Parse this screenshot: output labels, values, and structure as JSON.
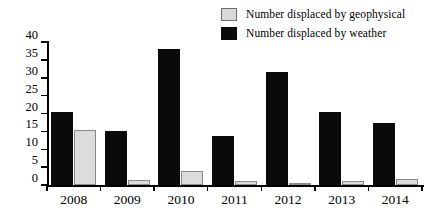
{
  "chart_data": {
    "type": "bar",
    "title": "",
    "subtitle": "",
    "xlabel": "",
    "ylabel": "",
    "categories": [
      "2008",
      "2009",
      "2010",
      "2011",
      "2012",
      "2013",
      "2014"
    ],
    "series": [
      {
        "name": "Number displaced by geophysical",
        "color": "#dcdcdc",
        "values": [
          15.5,
          1.5,
          4.0,
          1.0,
          0.5,
          1.0,
          1.7
        ]
      },
      {
        "name": "Number displaced by weather",
        "color": "#0a0a0a",
        "values": [
          20.5,
          15.0,
          38.0,
          13.7,
          31.5,
          20.5,
          17.3
        ]
      }
    ],
    "ylim": [
      0,
      40
    ],
    "yticks": [
      0,
      5,
      10,
      15,
      20,
      25,
      30,
      35,
      40
    ],
    "ytick_labels": [
      "0",
      "5",
      "10",
      "15",
      "20",
      "25",
      "30",
      "35",
      "40"
    ],
    "grid": false,
    "legend_position": "top-right",
    "annotations": []
  },
  "legend": {
    "items": [
      {
        "label": "Number displaced by geophysical",
        "swatch": "geophysical-swatch"
      },
      {
        "label": "Number displaced by weather",
        "swatch": "weather-swatch"
      }
    ]
  }
}
